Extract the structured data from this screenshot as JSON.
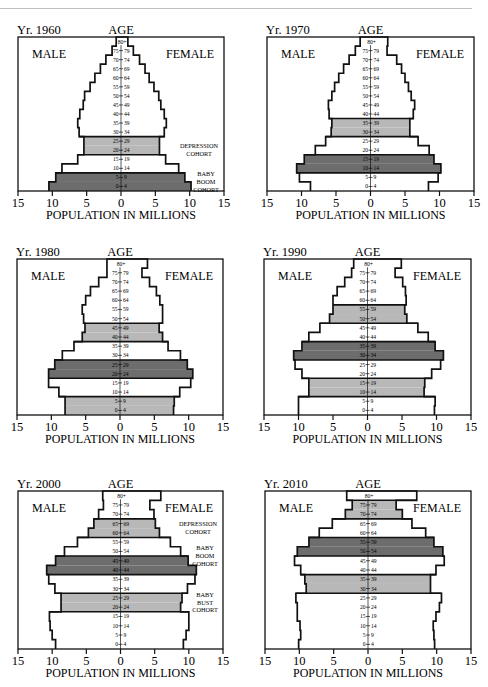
{
  "colors": {
    "dark": "#6d6d6d",
    "light": "#b8b8b8",
    "empty": "#ffffff",
    "line": "#111111"
  },
  "labels": {
    "age": "AGE",
    "male": "MALE",
    "female": "FEMALE",
    "xlabel": "POPULATION IN MILLIONS",
    "ticks": [
      "15",
      "10",
      "5",
      "0",
      "5",
      "10",
      "15"
    ]
  },
  "age_groups": [
    "0 - 4",
    "5 - 9",
    "10 - 14",
    "15 - 19",
    "20 - 24",
    "25 - 29",
    "30 - 34",
    "35 - 39",
    "40 - 44",
    "45 - 49",
    "50 - 54",
    "55 - 59",
    "60 - 64",
    "65 - 69",
    "70 - 74",
    "75 - 79",
    "80+"
  ],
  "chart_data": [
    {
      "type": "bar",
      "subtype": "population-pyramid",
      "title": "Yr. 1960",
      "xlabel": "POPULATION IN MILLIONS",
      "ylabel": "AGE",
      "xlim": [
        -15,
        15
      ],
      "categories": [
        "0-4",
        "5-9",
        "10-14",
        "15-19",
        "20-24",
        "25-29",
        "30-34",
        "35-39",
        "40-44",
        "45-49",
        "50-54",
        "55-59",
        "60-64",
        "65-69",
        "70-74",
        "75-79",
        "80+"
      ],
      "series": [
        {
          "name": "MALE",
          "values": [
            10.5,
            9.5,
            8.6,
            6.3,
            5.4,
            5.4,
            6.1,
            6.3,
            6.0,
            5.5,
            5.3,
            4.5,
            3.8,
            3.0,
            2.2,
            1.3,
            0.7
          ]
        },
        {
          "name": "FEMALE",
          "values": [
            10.2,
            9.3,
            8.4,
            6.5,
            5.6,
            5.6,
            6.3,
            6.6,
            6.3,
            5.8,
            5.5,
            4.8,
            4.1,
            3.5,
            2.7,
            1.8,
            1.0
          ]
        }
      ],
      "shading": [
        {
          "from": 0,
          "to": 1,
          "tone": "dark"
        },
        {
          "from": 4,
          "to": 5,
          "tone": "light"
        }
      ],
      "annotations": [
        {
          "lines": [
            "DEPRESSION",
            "COHORT"
          ],
          "at_group": 4.5
        },
        {
          "lines": [
            "BABY",
            "BOOM",
            "COHORT"
          ],
          "at_group": 1.0
        }
      ]
    },
    {
      "type": "bar",
      "subtype": "population-pyramid",
      "title": "Yr. 1970",
      "xlabel": "POPULATION IN MILLIONS",
      "ylabel": "AGE",
      "xlim": [
        -15,
        15
      ],
      "categories": [
        "0-4",
        "5-9",
        "10-14",
        "15-19",
        "20-24",
        "25-29",
        "30-34",
        "35-39",
        "40-44",
        "45-49",
        "50-54",
        "55-59",
        "60-64",
        "65-69",
        "70-74",
        "75-79",
        "80+"
      ],
      "series": [
        {
          "name": "MALE",
          "values": [
            8.7,
            10.3,
            10.7,
            9.6,
            8.0,
            6.5,
            5.7,
            5.6,
            6.0,
            6.1,
            5.6,
            5.2,
            4.6,
            3.9,
            3.1,
            2.2,
            1.5
          ]
        },
        {
          "name": "FEMALE",
          "values": [
            8.4,
            9.8,
            10.2,
            9.2,
            8.5,
            6.9,
            5.7,
            5.7,
            6.2,
            6.4,
            5.9,
            5.5,
            5.0,
            4.5,
            3.8,
            2.4,
            2.5
          ]
        }
      ],
      "shading": [
        {
          "from": 2,
          "to": 3,
          "tone": "dark"
        },
        {
          "from": 6,
          "to": 7,
          "tone": "light"
        }
      ],
      "annotations": []
    },
    {
      "type": "bar",
      "subtype": "population-pyramid",
      "title": "Yr. 1980",
      "xlabel": "POPULATION IN MILLIONS",
      "ylabel": "AGE",
      "xlim": [
        -15,
        15
      ],
      "categories": [
        "0-4",
        "5-9",
        "10-14",
        "15-19",
        "20-24",
        "25-29",
        "30-34",
        "35-39",
        "40-44",
        "45-49",
        "50-54",
        "55-59",
        "60-64",
        "65-69",
        "70-74",
        "75-79",
        "80+"
      ],
      "series": [
        {
          "name": "MALE",
          "values": [
            8.0,
            8.0,
            8.9,
            10.4,
            10.4,
            9.5,
            8.4,
            6.7,
            5.5,
            5.1,
            5.3,
            5.5,
            5.0,
            4.3,
            3.1,
            1.9,
            1.9
          ]
        },
        {
          "name": "FEMALE",
          "values": [
            7.8,
            7.9,
            8.7,
            10.3,
            10.6,
            9.8,
            8.8,
            7.0,
            6.2,
            5.7,
            6.2,
            6.2,
            5.8,
            5.3,
            4.3,
            3.2,
            4.0
          ]
        }
      ],
      "shading": [
        {
          "from": 0,
          "to": 1,
          "tone": "light"
        },
        {
          "from": 4,
          "to": 5,
          "tone": "dark"
        },
        {
          "from": 8,
          "to": 9,
          "tone": "light"
        }
      ],
      "annotations": []
    },
    {
      "type": "bar",
      "subtype": "population-pyramid",
      "title": "Yr. 1990",
      "xlabel": "POPULATION IN MILLIONS",
      "ylabel": "AGE",
      "xlim": [
        -15,
        15
      ],
      "categories": [
        "0-4",
        "5-9",
        "10-14",
        "15-19",
        "20-24",
        "25-29",
        "30-34",
        "35-39",
        "40-44",
        "45-49",
        "50-54",
        "55-59",
        "60-64",
        "65-69",
        "70-74",
        "75-79",
        "80+"
      ],
      "series": [
        {
          "name": "MALE",
          "values": [
            10.0,
            10.0,
            8.5,
            8.5,
            9.5,
            10.5,
            10.7,
            9.5,
            8.5,
            6.9,
            5.5,
            5.0,
            5.0,
            4.4,
            3.3,
            2.3,
            2.0
          ]
        },
        {
          "name": "FEMALE",
          "values": [
            9.7,
            9.8,
            8.2,
            8.3,
            9.3,
            10.6,
            11.0,
            9.8,
            8.8,
            7.3,
            5.7,
            5.4,
            5.6,
            5.5,
            5.1,
            4.0,
            4.9
          ]
        }
      ],
      "shading": [
        {
          "from": 2,
          "to": 3,
          "tone": "light"
        },
        {
          "from": 6,
          "to": 7,
          "tone": "dark"
        },
        {
          "from": 10,
          "to": 11,
          "tone": "light"
        }
      ],
      "annotations": []
    },
    {
      "type": "bar",
      "subtype": "population-pyramid",
      "title": "Yr. 2000",
      "xlabel": "POPULATION IN MILLIONS",
      "ylabel": "AGE",
      "xlim": [
        -15,
        15
      ],
      "categories": [
        "0-4",
        "5-9",
        "10-14",
        "15-19",
        "20-24",
        "25-29",
        "30-34",
        "35-39",
        "40-44",
        "45-49",
        "50-54",
        "55-59",
        "60-64",
        "65-69",
        "70-74",
        "75-79",
        "80+"
      ],
      "series": [
        {
          "name": "MALE",
          "values": [
            9.5,
            10.0,
            10.3,
            10.4,
            8.7,
            8.7,
            9.6,
            10.5,
            10.8,
            9.5,
            8.2,
            6.3,
            4.7,
            3.9,
            3.2,
            2.5,
            2.6
          ]
        },
        {
          "name": "FEMALE",
          "values": [
            9.2,
            9.6,
            10.0,
            10.0,
            8.8,
            9.0,
            9.8,
            10.9,
            11.1,
            9.9,
            8.8,
            7.3,
            5.7,
            5.1,
            4.9,
            4.3,
            5.9
          ]
        }
      ],
      "shading": [
        {
          "from": 4,
          "to": 5,
          "tone": "light"
        },
        {
          "from": 8,
          "to": 9,
          "tone": "dark"
        },
        {
          "from": 12,
          "to": 13,
          "tone": "light"
        }
      ],
      "annotations": [
        {
          "lines": [
            "DEPRESSION",
            "COHORT"
          ],
          "at_group": 13.0
        },
        {
          "lines": [
            "BABY",
            "BOOM",
            "COHORT"
          ],
          "at_group": 10.0
        },
        {
          "lines": [
            "BABY",
            "BUST",
            "COHORT"
          ],
          "at_group": 5.0
        }
      ]
    },
    {
      "type": "bar",
      "subtype": "population-pyramid",
      "title": "Yr. 2010",
      "xlabel": "POPULATION IN MILLIONS",
      "ylabel": "AGE",
      "xlim": [
        -15,
        15
      ],
      "categories": [
        "0-4",
        "5-9",
        "10-14",
        "15-19",
        "20-24",
        "25-29",
        "30-34",
        "35-39",
        "40-44",
        "45-49",
        "50-54",
        "55-59",
        "60-64",
        "65-69",
        "70-74",
        "75-79",
        "80+"
      ],
      "series": [
        {
          "name": "MALE",
          "values": [
            10.1,
            9.8,
            9.9,
            10.3,
            10.3,
            10.5,
            9.0,
            9.2,
            9.8,
            10.7,
            10.3,
            8.6,
            7.1,
            5.2,
            3.3,
            2.3,
            3.1
          ]
        },
        {
          "name": "FEMALE",
          "values": [
            9.7,
            9.6,
            9.5,
            9.9,
            10.4,
            10.7,
            9.1,
            9.1,
            9.9,
            11.1,
            10.9,
            9.6,
            8.4,
            6.4,
            5.0,
            4.1,
            7.1
          ]
        }
      ],
      "shading": [
        {
          "from": 6,
          "to": 7,
          "tone": "light"
        },
        {
          "from": 10,
          "to": 11,
          "tone": "dark"
        },
        {
          "from": 14,
          "to": 15,
          "tone": "light"
        }
      ],
      "annotations": []
    }
  ]
}
